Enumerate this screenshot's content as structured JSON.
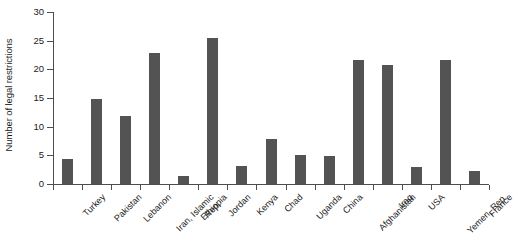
{
  "chart_data": {
    "type": "bar",
    "title": "",
    "xlabel": "",
    "ylabel": "Number of legal restrictions",
    "ylim": [
      0,
      30
    ],
    "yticks": [
      0,
      5,
      10,
      15,
      20,
      25,
      30
    ],
    "ytick_labels": [
      "0",
      "5",
      "10",
      "15",
      "20",
      "25",
      "30"
    ],
    "grid": false,
    "legend": null,
    "bar_color": "#535353",
    "axis_color": "#4d4d4d",
    "categories": [
      "Turkey",
      "Pakistan",
      "Lebanon",
      "Iran, Islamic Rep.",
      "Ethiopia",
      "Jordan",
      "Kenya",
      "Chad",
      "Uganda",
      "China",
      "Afghanistan",
      "Iraq",
      "USA",
      "Yemen, Rep.",
      "France"
    ],
    "category_lines": [
      [
        "Turkey"
      ],
      [
        "Pakistan"
      ],
      [
        "Lebanon"
      ],
      [
        "Iran, Islamic",
        "Rep."
      ],
      [
        "Ethiopia"
      ],
      [
        "Jordan"
      ],
      [
        "Kenya"
      ],
      [
        "Chad"
      ],
      [
        "Uganda"
      ],
      [
        "China"
      ],
      [
        "Afghanistan"
      ],
      [
        "Iraq"
      ],
      [
        "USA"
      ],
      [
        "Yemen, Rep."
      ],
      [
        "France"
      ]
    ],
    "values": [
      4.3,
      14.9,
      11.8,
      22.8,
      1.4,
      25.5,
      3.2,
      7.8,
      5.0,
      4.8,
      21.6,
      20.7,
      3.0,
      21.6,
      2.2
    ]
  }
}
